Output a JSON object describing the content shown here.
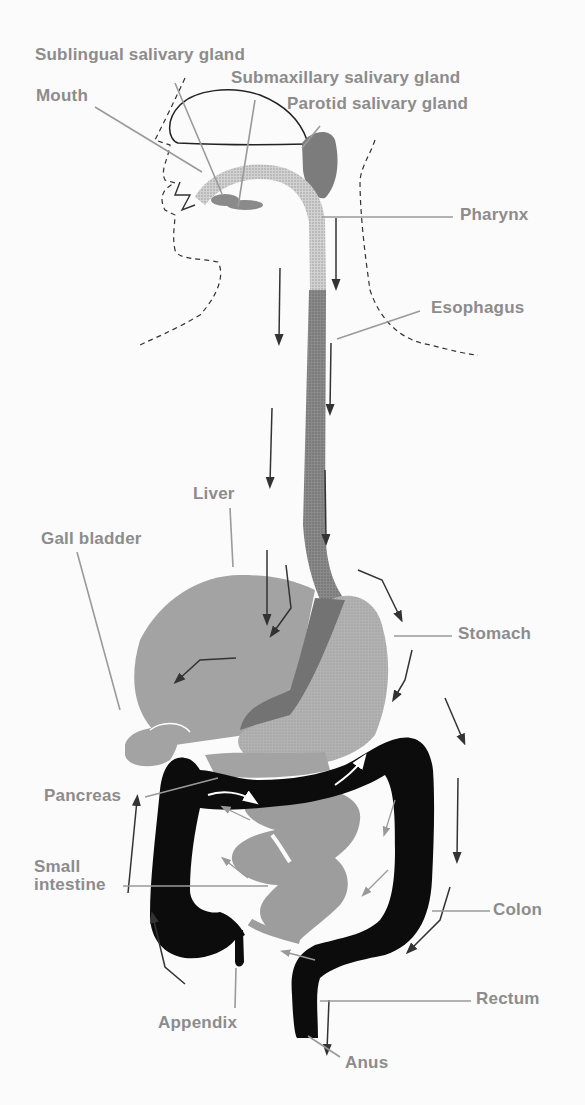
{
  "diagram": {
    "colors": {
      "label_text": "#8c8c8c",
      "leader_line": "#9a9a9a",
      "organ_light": "#a9a9a9",
      "organ_medium": "#8d8d8d",
      "organ_dark": "#6f6f6f",
      "colon": "#0a0a0a",
      "outline": "#222222",
      "background": "#fbfbfb"
    },
    "labels": {
      "sublingual": "Sublingual salivary gland",
      "submaxillary": "Submaxillary salivary gland",
      "mouth": "Mouth",
      "parotid": "Parotid salivary gland",
      "pharynx": "Pharynx",
      "esophagus": "Esophagus",
      "liver": "Liver",
      "gall_bladder": "Gall bladder",
      "stomach": "Stomach",
      "pancreas": "Pancreas",
      "small_intestine": "Small\nintestine",
      "colon": "Colon",
      "appendix": "Appendix",
      "rectum": "Rectum",
      "anus": "Anus"
    }
  }
}
